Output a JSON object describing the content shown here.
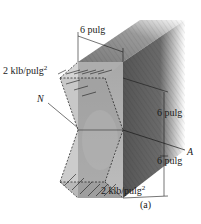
{
  "figure": {
    "caption": "(a)",
    "labels": {
      "top_width": "6 pulg",
      "top_stress_value": "2 klb/pulg",
      "top_stress_exp": "2",
      "neutral_axis_left": "N",
      "neutral_axis_right": "A",
      "upper_half_depth": "6 pulg",
      "lower_half_depth": "6 pulg",
      "bottom_stress_value": "2 klb/pulg",
      "bottom_stress_exp": "2"
    },
    "colors": {
      "wood_light": "#b5b5b5",
      "wood_mid": "#8c8c8c",
      "wood_dark": "#5e5e5e",
      "stress_fill": "#9a9a9a",
      "line": "#1a1a1a"
    }
  }
}
